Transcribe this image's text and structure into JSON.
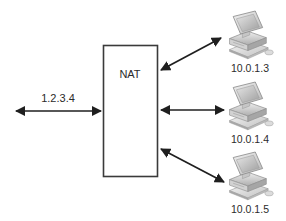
{
  "diagram": {
    "background_color": "#ffffff",
    "line_color": "#1f1f1f",
    "text_color": "#2b2b2b"
  },
  "nat_box": {
    "label": "NAT",
    "border_color": "#3a3a3a",
    "fill_color": "#ffffff"
  },
  "wan_link": {
    "label": "1.2.3.4",
    "arrow_type": "double-headed"
  },
  "hosts": [
    {
      "label": "10.0.1.3",
      "icon": "desktop-computer-icon",
      "arrow_type": "double-headed"
    },
    {
      "label": "10.0.1.4",
      "icon": "desktop-computer-icon",
      "arrow_type": "double-headed"
    },
    {
      "label": "10.0.1.5",
      "icon": "desktop-computer-icon",
      "arrow_type": "double-headed"
    }
  ]
}
